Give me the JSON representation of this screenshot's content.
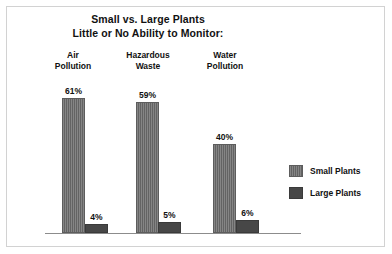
{
  "chart_data": {
    "type": "bar",
    "title": "Small vs. Large Plants",
    "subtitle": "Little or No Ability to Monitor:",
    "xlabel": "",
    "ylabel": "",
    "ylim": [
      0,
      68
    ],
    "grid": false,
    "legend_position": "right",
    "categories": [
      "Air Pollution",
      "Hazardous Waste",
      "Water Pollution"
    ],
    "category_lines": [
      [
        "Air",
        "Pollution"
      ],
      [
        "Hazardous",
        "Waste"
      ],
      [
        "Water",
        "Pollution"
      ]
    ],
    "series": [
      {
        "name": "Small Plants",
        "color": "#6e6e6e",
        "values": [
          61,
          59,
          40
        ],
        "labels": [
          "61%",
          "59%",
          "40%"
        ]
      },
      {
        "name": "Large Plants",
        "color": "#474747",
        "values": [
          4,
          5,
          6
        ],
        "labels": [
          "4%",
          "5%",
          "6%"
        ]
      }
    ]
  },
  "legend": {
    "items": [
      {
        "label": "Small Plants",
        "swatch": "small-plants-swatch"
      },
      {
        "label": "Large Plants",
        "swatch": "large-plants-swatch"
      }
    ]
  }
}
